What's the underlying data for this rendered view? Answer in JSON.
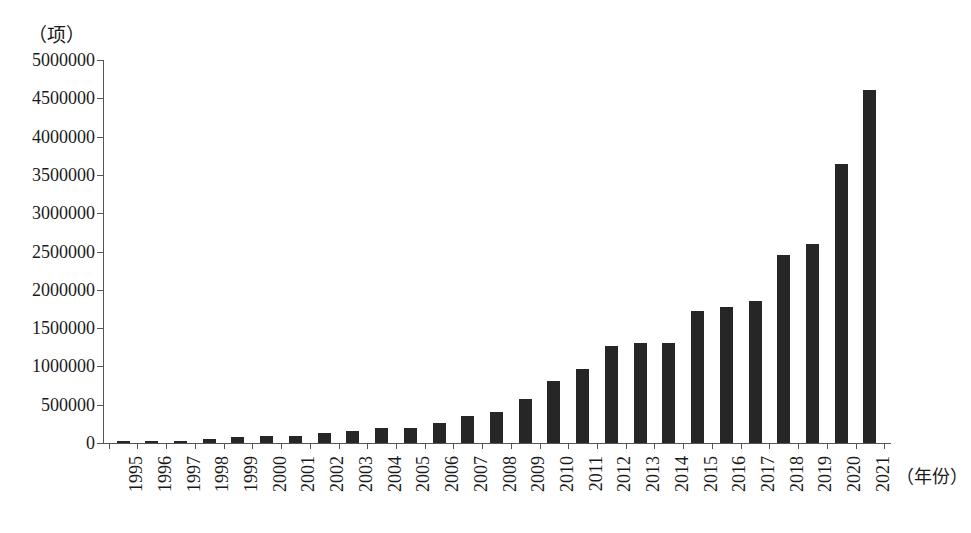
{
  "chart_data": {
    "type": "bar",
    "title": "",
    "subtitle": "",
    "xlabel": "（年份）",
    "ylabel": "（项）",
    "categories": [
      "1995",
      "1996",
      "1997",
      "1998",
      "1999",
      "2000",
      "2001",
      "2002",
      "2003",
      "2004",
      "2005",
      "2006",
      "2007",
      "2008",
      "2009",
      "2010",
      "2011",
      "2012",
      "2013",
      "2014",
      "2015",
      "2016",
      "2017",
      "2018",
      "2019",
      "2020",
      "2021"
    ],
    "values": [
      25000,
      30000,
      32000,
      48000,
      78000,
      95000,
      98000,
      125000,
      160000,
      190000,
      200000,
      260000,
      350000,
      400000,
      580000,
      810000,
      960000,
      1270000,
      1310000,
      1300000,
      1720000,
      1770000,
      1850000,
      2460000,
      2600000,
      3640000,
      4610000
    ],
    "ylim": [
      0,
      5000000
    ],
    "ytick_values": [
      0,
      500000,
      1000000,
      1500000,
      2000000,
      2500000,
      3000000,
      3500000,
      4000000,
      4500000,
      5000000
    ],
    "ytick_labels": [
      "0",
      "500000",
      "1000000",
      "1500000",
      "2000000",
      "2500000",
      "3000000",
      "3500000",
      "4000000",
      "4500000",
      "5000000"
    ],
    "grid": false,
    "legend": null,
    "legend_position": "none",
    "bar_color": "#262626",
    "axis_color": "#555555",
    "background_color": "#ffffff",
    "xtick_rotation": 90,
    "annotations": []
  }
}
